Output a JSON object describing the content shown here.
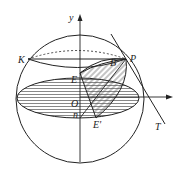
{
  "diagram": {
    "type": "geometry-sphere",
    "labels": {
      "y_axis": "y",
      "x_axis": "x",
      "K": "K",
      "P": "P",
      "B": "B",
      "E": "E",
      "O": "O",
      "n": "n",
      "E_prime": "E'",
      "T": "T"
    },
    "colors": {
      "stroke": "#222222",
      "hatch": "#444444",
      "background": "#ffffff"
    }
  }
}
